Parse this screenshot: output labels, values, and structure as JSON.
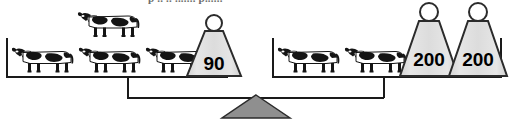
{
  "figure": {
    "kind": "balance-scale-equation-diagram",
    "clipped_caption": "p   .. ..  ....... p......"
  },
  "left_pan": {
    "cow_count": 4,
    "cows_bottom_row": 3,
    "cows_top_row": 1,
    "weights": [
      {
        "label": "90",
        "value": 90
      }
    ]
  },
  "right_pan": {
    "cow_count": 2,
    "cows_bottom_row": 2,
    "cows_top_row": 0,
    "weights": [
      {
        "label": "200",
        "value": 200
      },
      {
        "label": "200",
        "value": 200
      }
    ]
  },
  "colors": {
    "ink": "#1a1a1a",
    "weight_fill": "#dcdcdc",
    "weight_stroke": "#2b2b2b",
    "fulcrum_fill": "#8f8f8f",
    "fulcrum_stroke": "#2b2b2b",
    "cow_black": "#141414",
    "cow_white": "#ffffff",
    "caption_gray": "#6d6d6d"
  }
}
